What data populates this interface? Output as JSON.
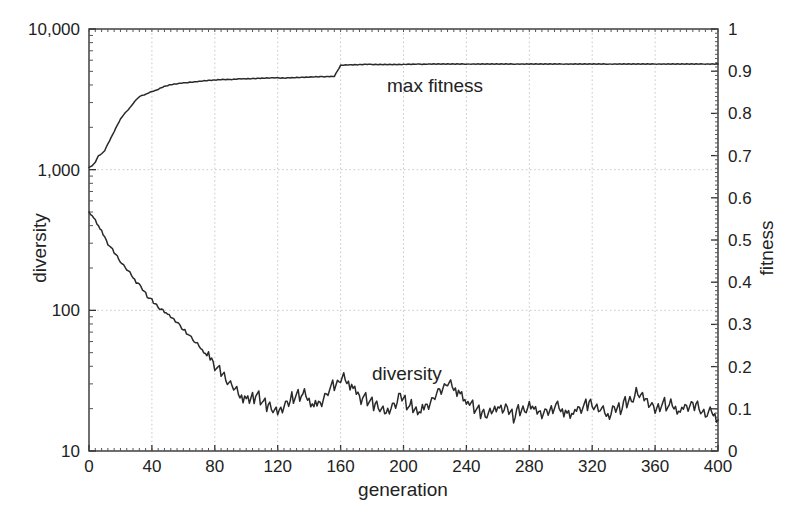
{
  "chart_data": {
    "type": "line",
    "title": "",
    "xlabel": "generation",
    "ylabel": "diversity",
    "y2label": "fitness",
    "xlim": [
      0,
      400
    ],
    "ylim": [
      10,
      10000
    ],
    "y2lim": [
      0,
      1
    ],
    "yscale": "log",
    "y2scale": "linear",
    "grid": true,
    "legend_position": "inline-annotations",
    "xticks": [
      "0",
      "40",
      "80",
      "120",
      "160",
      "200",
      "240",
      "280",
      "320",
      "360",
      "400"
    ],
    "xtick_values": [
      0,
      40,
      80,
      120,
      160,
      200,
      240,
      280,
      320,
      360,
      400
    ],
    "yticks": [
      "10",
      "100",
      "1,000",
      "10,000"
    ],
    "ytick_values": [
      10,
      100,
      1000,
      10000
    ],
    "y2ticks": [
      "0",
      "0.1",
      "0.2",
      "0.3",
      "0.4",
      "0.5",
      "0.6",
      "0.7",
      "0.8",
      "0.9",
      "1"
    ],
    "y2tick_values": [
      0,
      0.1,
      0.2,
      0.3,
      0.4,
      0.5,
      0.6,
      0.7,
      0.8,
      0.9,
      1
    ],
    "annotations": [
      {
        "text": "max fitness",
        "x": 196,
        "y_fitness": 0.875
      },
      {
        "text": "diversity",
        "x": 196,
        "y_diversity": 52
      }
    ],
    "series": [
      {
        "name": "max fitness",
        "axis": "right",
        "x": [
          0,
          2,
          4,
          6,
          8,
          10,
          12,
          14,
          16,
          18,
          20,
          22,
          24,
          26,
          28,
          30,
          32,
          34,
          36,
          38,
          40,
          42,
          44,
          46,
          48,
          50,
          52,
          54,
          56,
          58,
          60,
          64,
          68,
          72,
          76,
          80,
          84,
          88,
          92,
          96,
          100,
          108,
          116,
          124,
          132,
          140,
          148,
          156,
          160,
          164,
          168,
          176,
          184,
          192,
          200,
          216,
          232,
          248,
          264,
          280,
          300,
          320,
          340,
          360,
          380,
          400
        ],
        "values": [
          0.672,
          0.676,
          0.684,
          0.7,
          0.704,
          0.712,
          0.728,
          0.742,
          0.757,
          0.772,
          0.786,
          0.797,
          0.805,
          0.813,
          0.823,
          0.832,
          0.84,
          0.843,
          0.845,
          0.849,
          0.852,
          0.854,
          0.857,
          0.861,
          0.864,
          0.866,
          0.868,
          0.869,
          0.87,
          0.871,
          0.872,
          0.874,
          0.875,
          0.877,
          0.878,
          0.879,
          0.88,
          0.88,
          0.881,
          0.882,
          0.882,
          0.883,
          0.884,
          0.884,
          0.885,
          0.886,
          0.887,
          0.888,
          0.914,
          0.915,
          0.915,
          0.916,
          0.916,
          0.916,
          0.916,
          0.917,
          0.917,
          0.917,
          0.917,
          0.917,
          0.917,
          0.917,
          0.917,
          0.917,
          0.917,
          0.917
        ]
      },
      {
        "name": "diversity",
        "axis": "left",
        "x": [
          0,
          3,
          6,
          9,
          12,
          15,
          18,
          21,
          24,
          27,
          30,
          33,
          36,
          39,
          42,
          45,
          48,
          51,
          54,
          57,
          60,
          63,
          66,
          69,
          72,
          75,
          78,
          81,
          84,
          87,
          90,
          93,
          96,
          99,
          102,
          105,
          108,
          111,
          114,
          117,
          120,
          123,
          126,
          129,
          132,
          135,
          138,
          141,
          144,
          147,
          150,
          153,
          156,
          159,
          162,
          165,
          168,
          171,
          174,
          177,
          180,
          183,
          186,
          189,
          192,
          195,
          198,
          201,
          204,
          207,
          210,
          213,
          216,
          219,
          222,
          225,
          228,
          231,
          234,
          237,
          240,
          243,
          246,
          249,
          252,
          255,
          258,
          261,
          264,
          267,
          270,
          273,
          276,
          279,
          282,
          285,
          288,
          291,
          294,
          297,
          300,
          303,
          306,
          309,
          312,
          315,
          318,
          321,
          324,
          327,
          330,
          333,
          336,
          339,
          342,
          345,
          348,
          351,
          354,
          357,
          360,
          363,
          366,
          369,
          372,
          375,
          378,
          381,
          384,
          387,
          390,
          393,
          396,
          400
        ],
        "values": [
          500,
          455,
          400,
          345,
          300,
          268,
          240,
          215,
          195,
          178,
          160,
          146,
          132,
          120,
          112,
          104,
          97,
          92,
          86,
          80,
          73,
          68,
          62,
          57,
          52,
          48,
          44,
          40,
          36,
          33,
          30,
          27,
          25,
          24,
          23,
          25,
          24,
          22,
          21,
          20,
          19,
          20,
          22,
          24,
          25,
          26,
          24,
          22,
          21,
          22,
          25,
          27,
          29,
          31,
          33,
          31,
          28,
          26,
          24,
          23,
          22,
          21,
          20,
          19,
          20,
          22,
          24,
          23,
          21,
          20,
          19,
          20,
          22,
          24,
          26,
          28,
          30,
          29,
          27,
          25,
          22,
          21,
          20,
          19,
          18,
          19,
          20,
          21,
          20,
          19,
          18,
          19,
          20,
          21,
          20,
          19,
          18,
          19,
          20,
          21,
          20,
          19,
          18,
          19,
          20,
          21,
          22,
          21,
          20,
          19,
          18,
          19,
          20,
          21,
          22,
          24,
          26,
          25,
          23,
          21,
          20,
          21,
          22,
          21,
          20,
          19,
          20,
          21,
          22,
          21,
          19,
          18,
          19,
          17
        ]
      }
    ]
  },
  "axis": {
    "left_title": "diversity",
    "right_title": "fitness",
    "bottom_title": "generation"
  },
  "labels": {
    "max_fitness": "max fitness",
    "diversity": "diversity"
  },
  "colors": {
    "curve": "#2a2a2a",
    "grid": "#c9c9c9",
    "frame": "#333333",
    "background": "#ffffff"
  }
}
